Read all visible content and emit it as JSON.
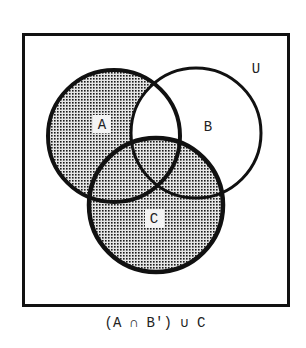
{
  "diagram": {
    "type": "venn",
    "universe_label": "U",
    "sets": [
      {
        "name": "A",
        "label": "A",
        "cx": 114,
        "cy": 136,
        "r": 66,
        "shaded": true
      },
      {
        "name": "B",
        "label": "B",
        "cx": 196,
        "cy": 133,
        "r": 65,
        "shaded": false
      },
      {
        "name": "C",
        "label": "C",
        "cx": 156,
        "cy": 205,
        "r": 67,
        "shaded": true
      }
    ],
    "shaded_region": "(A ∩ B') ∪ C",
    "caption": "(A ∩ B') ∪ C",
    "colors": {
      "stroke": "#111111",
      "shade_dot": "#1a1a1a",
      "shade_bg": "#d8d8d8",
      "background": "#ffffff"
    }
  }
}
